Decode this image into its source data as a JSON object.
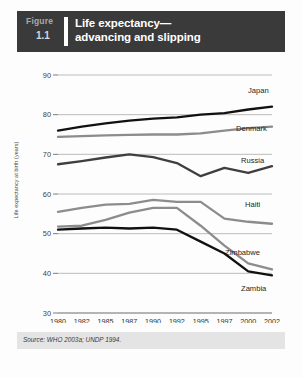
{
  "header": {
    "figure_word": "Figure",
    "figure_number": "1.1",
    "title_line1": "Life expectancy—",
    "title_line2": "advancing and slipping"
  },
  "source": {
    "text": "Source: WHO 2003a; UNDP 1994."
  },
  "colors": {
    "header_bg": "#3a3a3a",
    "page_bg": "#fdfdfd",
    "grid": "#b4b4b4",
    "axis": "#6d6d6d",
    "source_bg": "#e4e4e4",
    "japan": "#111111",
    "denmark": "#8c8c8c",
    "russia": "#3f3f3f",
    "haiti": "#8c8c8c",
    "zimbabwe": "#8c8c8c",
    "zambia": "#111111"
  },
  "chart_data": {
    "type": "line",
    "xlabel": "",
    "ylabel": "Life expectancy at birth (years)",
    "ylim": [
      30,
      90
    ],
    "yticks": [
      30,
      40,
      50,
      60,
      70,
      80,
      90
    ],
    "grid": true,
    "legend": "right-inline-labels",
    "categories": [
      "1980",
      "1982",
      "1985",
      "1987",
      "1990",
      "1992",
      "1995",
      "1997",
      "2000",
      "2002"
    ],
    "series": [
      {
        "name": "Japan",
        "values": [
          76.0,
          77.0,
          77.8,
          78.5,
          79.0,
          79.3,
          80.0,
          80.4,
          81.3,
          82.0
        ]
      },
      {
        "name": "Denmark",
        "values": [
          74.4,
          74.6,
          74.8,
          74.9,
          75.0,
          75.0,
          75.3,
          76.0,
          76.6,
          77.0
        ]
      },
      {
        "name": "Russia",
        "values": [
          67.5,
          68.3,
          69.2,
          70.0,
          69.3,
          67.8,
          64.5,
          66.6,
          65.3,
          67.0
        ]
      },
      {
        "name": "Haiti",
        "values": [
          55.5,
          56.5,
          57.3,
          57.5,
          58.5,
          58.0,
          58.0,
          53.8,
          53.0,
          52.5
        ]
      },
      {
        "name": "Zimbabwe",
        "values": [
          51.8,
          52.0,
          53.5,
          55.3,
          56.5,
          56.5,
          52.0,
          47.0,
          42.5,
          41.0
        ]
      },
      {
        "name": "Zambia",
        "values": [
          51.0,
          51.3,
          51.5,
          51.3,
          51.5,
          51.0,
          48.0,
          45.0,
          40.5,
          39.5
        ]
      }
    ],
    "series_label_positions": [
      {
        "name": "Japan",
        "x": 248,
        "y": 93
      },
      {
        "name": "Denmark",
        "x": 236,
        "y": 131
      },
      {
        "name": "Russia",
        "x": 241,
        "y": 163
      },
      {
        "name": "Haiti",
        "x": 245,
        "y": 207
      },
      {
        "name": "Zimbabwe",
        "x": 225,
        "y": 255
      },
      {
        "name": "Zambia",
        "x": 241,
        "y": 291
      }
    ]
  }
}
